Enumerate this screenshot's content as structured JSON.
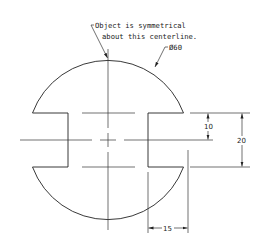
{
  "drawing": {
    "note_line1": "Object is symmetrical",
    "note_line2": "about this centerline.",
    "diameter_label": "Ø60",
    "dim_notch_half": "10",
    "dim_notch_full": "20",
    "dim_notch_depth": "15"
  },
  "geometry_data": {
    "diameter": 60,
    "notch_width": 20,
    "notch_half_width": 10,
    "notch_depth": 15
  }
}
